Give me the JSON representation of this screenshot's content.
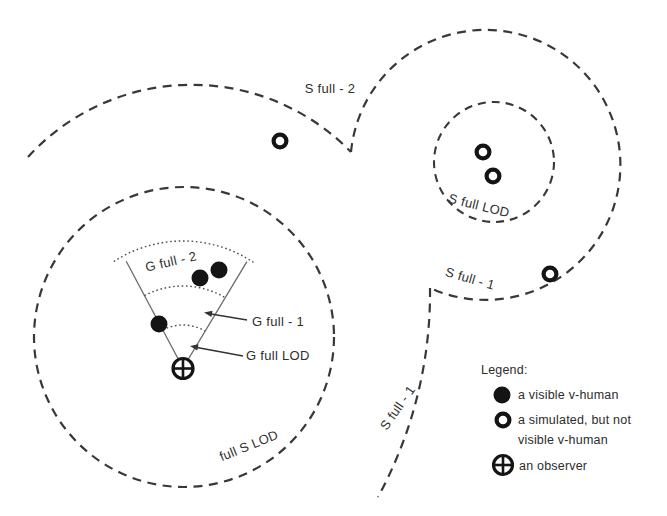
{
  "diagram": {
    "title_semantic": "level-of-detail zones around an observer",
    "region_labels": {
      "s_full_2": "S full - 2",
      "s_full_lod_right": "S full LOD",
      "s_full_1_right": "S full - 1",
      "s_full_1_left": "S full - 1",
      "full_s_lod": "full S LOD",
      "g_full_2": "G full - 2",
      "g_full_1": "G full - 1",
      "g_full_lod": "G full LOD"
    },
    "markers": {
      "visible_vhuman_count": 3,
      "simulated_not_visible_count": 4,
      "observer_count": 1
    },
    "colors": {
      "ink": "#2e2e2e",
      "background": "#ffffff"
    }
  },
  "legend": {
    "title": "Legend:",
    "items": [
      {
        "symbol": "filled-circle",
        "lines": [
          "a visible v-human"
        ]
      },
      {
        "symbol": "open-circle",
        "lines": [
          "a simulated, but not",
          "visible v-human"
        ]
      },
      {
        "symbol": "observer-crossed-circle",
        "lines": [
          "an observer"
        ]
      }
    ]
  }
}
